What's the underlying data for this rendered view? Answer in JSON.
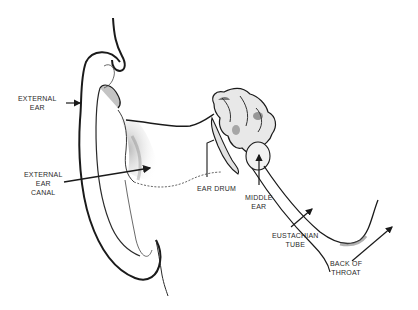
{
  "diagram": {
    "labels": {
      "external_ear": [
        "EXTERNAL",
        "EAR"
      ],
      "external_ear_canal": [
        "EXTERNAL",
        "EAR",
        "CANAL"
      ],
      "ear_drum": [
        "EAR DRUM"
      ],
      "middle_ear": [
        "MIDDLE",
        "EAR"
      ],
      "eustachian_tube": [
        "EUSTACHIAN",
        "TUBE"
      ],
      "back_of_throat": [
        "BACK OF",
        "THROAT"
      ]
    },
    "colors": {
      "ink": "#1a1a1a",
      "shading": "#8a8a8a",
      "background": "#ffffff"
    }
  }
}
